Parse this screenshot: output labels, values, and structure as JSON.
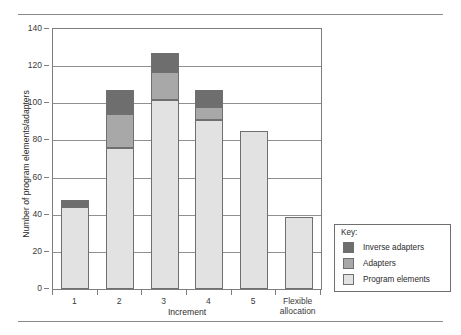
{
  "chart_data": {
    "type": "bar",
    "subtype": "stacked-bar",
    "title": "",
    "xlabel": "Increment",
    "ylabel": "Number of program elements/adapters",
    "categories": [
      "1",
      "2",
      "3",
      "4",
      "5",
      "Flexible\nallocation"
    ],
    "category_labels": [
      {
        "line1": "1",
        "line2": ""
      },
      {
        "line1": "2",
        "line2": ""
      },
      {
        "line1": "3",
        "line2": ""
      },
      {
        "line1": "4",
        "line2": ""
      },
      {
        "line1": "5",
        "line2": ""
      },
      {
        "line1": "Flexible",
        "line2": "allocation"
      }
    ],
    "series": [
      {
        "name": "Program elements",
        "color": "#e2e2e2",
        "values": [
          44,
          76,
          102,
          91,
          85,
          39
        ]
      },
      {
        "name": "Adapters",
        "color": "#a8a8a8",
        "values": [
          0,
          18,
          15,
          7,
          0,
          0
        ]
      },
      {
        "name": "Inverse adapters",
        "color": "#6e6e6e",
        "values": [
          4,
          13,
          10,
          9,
          0,
          0
        ]
      }
    ],
    "totals": [
      48,
      107,
      127,
      107,
      85,
      39
    ],
    "ylim": [
      0,
      140
    ],
    "ytick_values": [
      0,
      20,
      40,
      60,
      80,
      100,
      120,
      140
    ],
    "ytick_labels": [
      "0",
      "20",
      "40",
      "60",
      "80",
      "100",
      "120",
      "140"
    ],
    "grid": true,
    "grid_axis": "y",
    "legend_position": "right-outside",
    "bar_border_color": "#6f6f6f",
    "axis_color": "#7d7d7d"
  },
  "legend": {
    "title": "Key:",
    "entries": [
      {
        "label": "Inverse adapters",
        "color": "#6e6e6e"
      },
      {
        "label": "Adapters",
        "color": "#a8a8a8"
      },
      {
        "label": "Program elements",
        "color": "#e2e2e2"
      }
    ]
  }
}
